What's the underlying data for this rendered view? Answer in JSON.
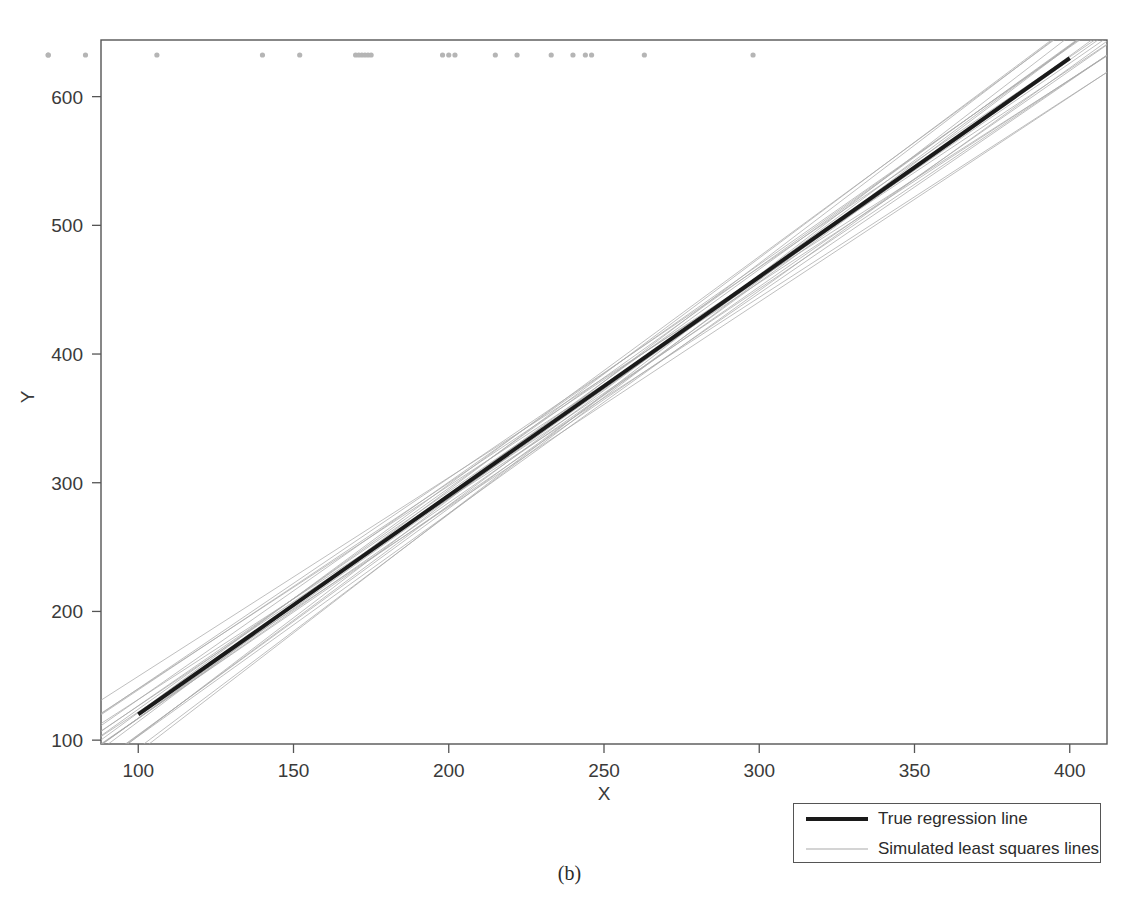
{
  "figure": {
    "caption": "(b)"
  },
  "legend": {
    "position": "bottom-right",
    "entries": [
      {
        "label": "True regression line",
        "color": "#1a1a1a",
        "width": 4
      },
      {
        "label": "Simulated least squares lines",
        "color": "#a9a9a9",
        "width": 1
      }
    ]
  },
  "chart_data": {
    "type": "line",
    "title": "",
    "subtitle": "",
    "xlabel": "X",
    "ylabel": "Y",
    "xlim": [
      88,
      412
    ],
    "ylim": [
      97,
      644
    ],
    "xticks": [
      100,
      150,
      200,
      250,
      300,
      350,
      400
    ],
    "yticks": [
      100,
      200,
      300,
      400,
      500,
      600
    ],
    "grid": false,
    "legend_position": "bottom-right",
    "series": [
      {
        "name": "True regression line",
        "type": "line",
        "color": "#1a1a1a",
        "linewidth": 4,
        "intercept": -50,
        "slope": 1.7,
        "x": [
          100,
          400
        ],
        "y": [
          120,
          630
        ]
      },
      {
        "name": "Simulated least squares lines",
        "type": "line-bundle",
        "color": "#a9a9a9",
        "linewidth": 1,
        "count": 22,
        "pivot_x": 232,
        "pivot_y": 344,
        "x_extent": [
          88,
          412
        ],
        "slopes": [
          1.545,
          1.562,
          1.578,
          1.593,
          1.608,
          1.621,
          1.636,
          1.651,
          1.664,
          1.678,
          1.69,
          1.705,
          1.718,
          1.731,
          1.744,
          1.758,
          1.772,
          1.786,
          1.801,
          1.818,
          1.836,
          1.855
        ],
        "intercept_offsets": [
          9.5,
          -6.2,
          4.1,
          -11.8,
          7.3,
          -3.5,
          12.0,
          -9.1,
          2.4,
          -5.8,
          10.6,
          -1.9,
          6.8,
          -12.5,
          3.2,
          -7.7,
          11.3,
          -4.4,
          8.1,
          -10.3,
          1.6,
          -8.6
        ]
      },
      {
        "name": "Data rug (X values)",
        "type": "rug",
        "color": "#b5b5b5",
        "marker_size": 4,
        "y_pixel_row": 55,
        "x_values": [
          71,
          106,
          140,
          152,
          170,
          171,
          172,
          173,
          174,
          175,
          198,
          200,
          202,
          215,
          222,
          233,
          240,
          244,
          246,
          263,
          298
        ],
        "x_values_offscreen_left": [
          71,
          83
        ]
      }
    ],
    "annotations": []
  },
  "axes": {
    "x_title": "X",
    "y_title": "Y",
    "x_tick_labels": [
      "100",
      "150",
      "200",
      "250",
      "300",
      "350",
      "400"
    ],
    "y_tick_labels": [
      "100",
      "200",
      "300",
      "400",
      "500",
      "600"
    ]
  },
  "colors": {
    "true_line": "#1a1a1a",
    "simulated_lines": "#a9a9a9",
    "rug_points": "#b5b5b5",
    "axis": "#555555",
    "background": "#ffffff"
  }
}
